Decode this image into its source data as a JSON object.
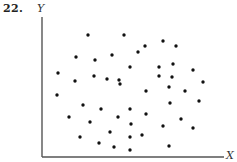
{
  "problem_number": "22.",
  "chart_data": {
    "type": "scatter",
    "title": "",
    "xlabel": "X",
    "ylabel": "Y",
    "grid": false,
    "legend": null,
    "axis_pixels": {
      "origin": [
        42,
        157
      ],
      "x_end": 224,
      "y_top": 17
    },
    "points_px": [
      [
        88,
        35
      ],
      [
        124,
        35
      ],
      [
        163,
        41
      ],
      [
        176,
        46
      ],
      [
        145,
        46
      ],
      [
        138,
        52
      ],
      [
        76,
        57
      ],
      [
        112,
        55
      ],
      [
        95,
        60
      ],
      [
        130,
        67
      ],
      [
        159,
        67
      ],
      [
        173,
        64
      ],
      [
        193,
        70
      ],
      [
        58,
        73
      ],
      [
        75,
        81
      ],
      [
        94,
        76
      ],
      [
        107,
        79
      ],
      [
        119,
        80
      ],
      [
        120,
        84
      ],
      [
        159,
        76
      ],
      [
        172,
        77
      ],
      [
        203,
        82
      ],
      [
        146,
        91
      ],
      [
        169,
        87
      ],
      [
        185,
        91
      ],
      [
        57,
        95
      ],
      [
        83,
        105
      ],
      [
        101,
        109
      ],
      [
        130,
        109
      ],
      [
        170,
        103
      ],
      [
        199,
        101
      ],
      [
        69,
        117
      ],
      [
        90,
        122
      ],
      [
        118,
        117
      ],
      [
        146,
        114
      ],
      [
        131,
        124
      ],
      [
        163,
        126
      ],
      [
        181,
        119
      ],
      [
        193,
        128
      ],
      [
        80,
        137
      ],
      [
        110,
        132
      ],
      [
        130,
        137
      ],
      [
        142,
        135
      ],
      [
        99,
        143
      ],
      [
        114,
        147
      ],
      [
        130,
        150
      ],
      [
        169,
        146
      ]
    ],
    "colors": {
      "points": "#111111",
      "axes": "#555555"
    }
  }
}
